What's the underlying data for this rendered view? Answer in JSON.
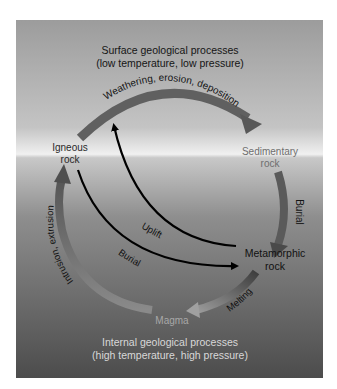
{
  "diagram": {
    "title_top": {
      "line1": "Surface geological processes",
      "line2": "(low temperature, low pressure)"
    },
    "title_bottom": {
      "line1": "Internal geological processes",
      "line2": "(high temperature, high pressure)"
    },
    "nodes": {
      "igneous": {
        "line1": "Igneous",
        "line2": "rock"
      },
      "sedimentary": {
        "line1": "Sedimentary",
        "line2": "rock"
      },
      "metamorphic": {
        "line1": "Metamorphic",
        "line2": "rock"
      },
      "magma": {
        "label": "Magma"
      }
    },
    "processes": {
      "weathering": "Weathering, erosion, deposition",
      "burial_right": "Burial",
      "melting": "Melting",
      "intrusion": "Intrusion, extrusion",
      "uplift": "Uplift",
      "burial_inner": "Burial"
    },
    "colors": {
      "panel_top": "#9a9a9a",
      "horizon": "#f2f2f2",
      "panel_bottom": "#4f4f4f",
      "cycle_arrow": "#5f5f5f",
      "inner_arrow": "#000000",
      "text_dark": "#111111",
      "text_light": "#d9d9d9"
    }
  }
}
